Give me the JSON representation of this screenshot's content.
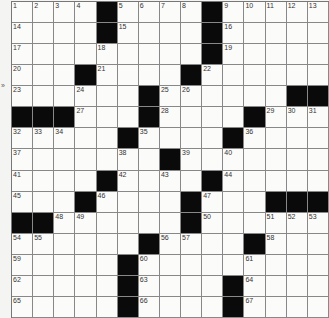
{
  "puzzle": {
    "rows": 15,
    "cols": 15,
    "side_mark": "»",
    "colors": {
      "black": "#0a0a0a",
      "white": "#fbfbf9",
      "grid_line": "#888888"
    },
    "grid": [
      "....#....#.....",
      "....#....#.....",
      ".........#.....",
      "...#....#......",
      "......#......##",
      "###...#....#...",
      ".....#....#....",
      ".......#.......",
      "....#....#.....",
      "...#....#...###",
      "##......#......",
      "......#....#...",
      ".....#.........",
      ".....#....#....",
      ".....#....#...."
    ]
  }
}
